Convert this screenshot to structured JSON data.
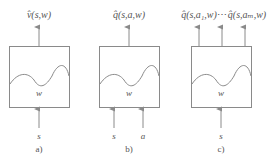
{
  "diagram": {
    "panels": [
      {
        "id": "a",
        "caption": "a)",
        "outputs": [
          "v̂(s,w)"
        ],
        "weight_label": "w",
        "inputs": [
          "s"
        ]
      },
      {
        "id": "b",
        "caption": "b)",
        "outputs": [
          "q̂(s,a,w)"
        ],
        "weight_label": "w",
        "inputs": [
          "s",
          "a"
        ]
      },
      {
        "id": "c",
        "caption": "c)",
        "outputs": [
          "q̂(s,a₁,w)",
          "q̂(s,aₘ,w)"
        ],
        "ellipsis": "⋯",
        "weight_label": "w",
        "inputs": [
          "s"
        ]
      }
    ],
    "colors": {
      "line": "#8a8a8a",
      "text": "#555555",
      "background": "#ffffff"
    }
  }
}
